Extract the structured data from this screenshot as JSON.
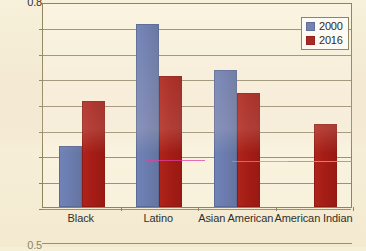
{
  "chart_data": {
    "type": "bar",
    "title": "",
    "subtitle": "",
    "xlabel": "",
    "ylabel": "",
    "categories": [
      "Black",
      "Latino",
      "Asian American",
      "American Indian"
    ],
    "series": [
      {
        "name": "2000",
        "color": "#6d7fb3",
        "values": [
          0.24,
          0.715,
          0.535,
          null
        ]
      },
      {
        "name": "2016",
        "color": "#a81f18",
        "values": [
          0.415,
          0.51,
          0.445,
          0.325
        ]
      }
    ],
    "ylim": [
      0,
      0.8
    ],
    "ytick_labels": [
      "0.8",
      "0.7",
      "0.6",
      "0.5",
      "0.4",
      "0.3",
      "0.2",
      "0.1",
      "0"
    ],
    "ytick_values": [
      0.8,
      0.7,
      0.6,
      0.5,
      0.4,
      0.3,
      0.2,
      0.1,
      0
    ],
    "grid": true,
    "legend_position": "top-right",
    "legend_entries": [
      "2000",
      "2016"
    ]
  },
  "ticks": [
    {
      "label": "0.8",
      "value": 0.8
    },
    {
      "label": "0.7",
      "value": 0.7
    },
    {
      "label": "0.6",
      "value": 0.6
    },
    {
      "label": "0.5",
      "value": 0.5
    },
    {
      "label": "0.4",
      "value": 0.4
    },
    {
      "label": "0.3",
      "value": 0.3
    },
    {
      "label": "0.2",
      "value": 0.2
    },
    {
      "label": "0.1",
      "value": 0.1
    },
    {
      "label": "0",
      "value": 0.0
    }
  ],
  "legend": {
    "items": [
      {
        "label": "2000",
        "color": "#6d7fb3"
      },
      {
        "label": "2016",
        "color": "#a81f18"
      }
    ]
  },
  "clipped": {
    "top_tick_label": "0.8",
    "next_chart_tick_label": "0.5"
  },
  "colors": {
    "background": "#f6efd8",
    "grid": "#8a8260",
    "axis": "#8d8560",
    "series_2000": "#6d7fb3",
    "series_2016": "#a81f18",
    "text": "#33302a"
  }
}
